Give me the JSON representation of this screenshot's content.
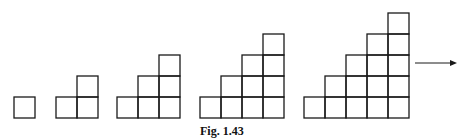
{
  "figure": {
    "caption": "Fig. 1.43",
    "cell_size": 21,
    "baseline_y": 118,
    "stroke_color": "#1a1a1a",
    "patterns": [
      {
        "steps": 1,
        "squares": 1,
        "left_x": 14
      },
      {
        "steps": 2,
        "squares": 3,
        "left_x": 56
      },
      {
        "steps": 3,
        "squares": 6,
        "left_x": 117
      },
      {
        "steps": 4,
        "squares": 10,
        "left_x": 200
      },
      {
        "steps": 5,
        "squares": 15,
        "left_x": 304
      }
    ],
    "arrow": {
      "x1": 415,
      "x2": 457,
      "y": 63,
      "meaning": "continues"
    }
  }
}
